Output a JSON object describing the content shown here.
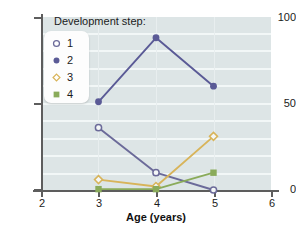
{
  "chart_data": {
    "type": "line",
    "title": "",
    "xlabel": "Age (years)",
    "ylabel": "",
    "x": [
      3,
      4,
      5
    ],
    "xlim": [
      2,
      6
    ],
    "ylim": [
      0,
      100
    ],
    "xticks": [
      "2",
      "3",
      "4",
      "5",
      "6"
    ],
    "yticks": [
      "0",
      "50",
      "100"
    ],
    "grid": "horizontal-white-gridlines",
    "legend_position": "top-left-inside",
    "legend_title": "Development step:",
    "series": [
      {
        "name": "1",
        "values": [
          36,
          10,
          0
        ],
        "color": "#6b6a99",
        "marker": "open-circle"
      },
      {
        "name": "2",
        "values": [
          51,
          88,
          60
        ],
        "color": "#5a5a96",
        "marker": "filled-circle"
      },
      {
        "name": "3",
        "values": [
          6,
          2,
          31
        ],
        "color": "#d8b45a",
        "marker": "open-diamond"
      },
      {
        "name": "4",
        "values": [
          0.5,
          0.5,
          10
        ],
        "color": "#8aab5a",
        "marker": "filled-square"
      }
    ]
  },
  "axes": {
    "y_ticks": [
      {
        "label": "100",
        "value": 100
      },
      {
        "label": "50",
        "value": 50
      },
      {
        "label": "0",
        "value": 0
      }
    ],
    "x_ticks": [
      {
        "label": "2",
        "value": 2
      },
      {
        "label": "3",
        "value": 3
      },
      {
        "label": "4",
        "value": 4
      },
      {
        "label": "5",
        "value": 5
      },
      {
        "label": "6",
        "value": 6
      }
    ],
    "x_title": "Age (years)"
  },
  "legend": {
    "title": "Development step:",
    "items": [
      {
        "label": "1",
        "color": "#6b6a99",
        "marker": "open-circle"
      },
      {
        "label": "2",
        "color": "#5a5a96",
        "marker": "filled-circle"
      },
      {
        "label": "3",
        "color": "#d8b45a",
        "marker": "open-diamond"
      },
      {
        "label": "4",
        "color": "#8aab5a",
        "marker": "filled-square"
      }
    ]
  },
  "colors": {
    "plot_background": "#dde5e6",
    "gridline": "#f2f7f7",
    "axis": "#5d5d5d",
    "text": "#1b1b1b",
    "series_1": "#6b6a99",
    "series_2": "#5a5a96",
    "series_3": "#d8b45a",
    "series_4": "#8aab5a"
  }
}
